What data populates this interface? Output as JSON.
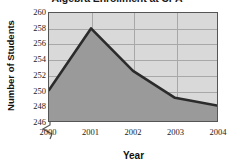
{
  "chart_data": {
    "type": "area",
    "title": "Algebra Enrollment at CPA",
    "xlabel": "Year",
    "ylabel": "Number of Students",
    "categories": [
      "2000",
      "2001",
      "2002",
      "2003",
      "2004"
    ],
    "values": [
      250,
      258,
      252.5,
      249,
      248
    ],
    "x": [
      2000,
      2001,
      2002,
      2003,
      2004
    ],
    "ylim": [
      246,
      260
    ],
    "xlim": [
      2000,
      2004
    ],
    "ytick_labels": [
      "246",
      "248",
      "250",
      "252",
      "254",
      "256",
      "258",
      "260"
    ],
    "ytick_values": [
      246,
      248,
      250,
      252,
      254,
      256,
      258,
      260
    ],
    "xtick_labels": [
      "2000",
      "2001",
      "2002",
      "2003",
      "2004"
    ],
    "grid": true,
    "legend": null,
    "axis_break": true,
    "axis_break_note": "y-axis broken below 246",
    "colors": {
      "plot_background": "#d9d9d9",
      "area_fill": "#9a9a9a",
      "line": "#2b2b2b",
      "gridline": "#a8a8a8",
      "frame": "#555555",
      "text": "#111111"
    }
  }
}
